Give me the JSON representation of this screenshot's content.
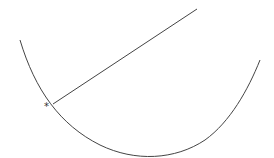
{
  "diagram": {
    "curve": {
      "type": "parabola-like",
      "stroke": "#444444"
    },
    "line": {
      "type": "tangent/normal segment",
      "stroke": "#444444"
    },
    "marker": {
      "label": "*"
    }
  }
}
